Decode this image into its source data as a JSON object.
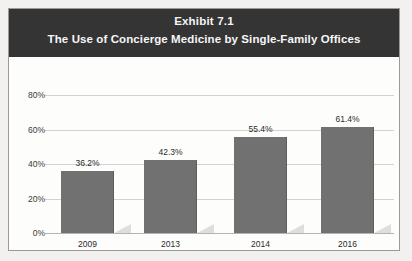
{
  "chart_data": {
    "type": "bar",
    "title": "Exhibit 7.1",
    "subtitle": "The Use of Concierge Medicine by Single-Family Offices",
    "categories": [
      "2009",
      "2013",
      "2014",
      "2016"
    ],
    "values": [
      36.2,
      42.3,
      55.4,
      61.4
    ],
    "data_labels": [
      "36.2%",
      "42.3%",
      "55.4%",
      "61.4%"
    ],
    "xlabel": "",
    "ylabel": "",
    "ylim": [
      0,
      80
    ],
    "ytick_labels": [
      "0%",
      "20%",
      "40%",
      "60%",
      "80%"
    ],
    "ytick_values": [
      0,
      20,
      40,
      60,
      80
    ],
    "grid": true,
    "legend": "none",
    "colors": {
      "bar": "#717171",
      "header_band": "#343434",
      "header_text": "#ffffff",
      "gridline": "#d2d2d2",
      "frame_border": "#9a9a9a",
      "plot_background": "#fdfdfc",
      "page_background": "#f2f1ef",
      "bar_shadow": "#dedede"
    }
  }
}
